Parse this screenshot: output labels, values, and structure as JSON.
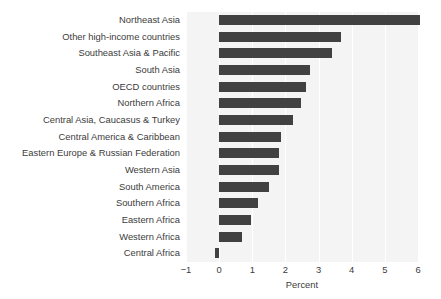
{
  "chart_data": {
    "type": "bar",
    "orientation": "horizontal",
    "title": "",
    "xlabel": "Percent",
    "ylabel": "",
    "xlim": [
      -1,
      6
    ],
    "xticks": [
      -1,
      0,
      1,
      2,
      3,
      4,
      5,
      6
    ],
    "xtick_labels": [
      "−1",
      "0",
      "1",
      "2",
      "3",
      "4",
      "5",
      "6"
    ],
    "grid": true,
    "grid_axis": "x",
    "legend": null,
    "bar_color": "#414141",
    "plot_background": "#f4f4f4",
    "gridline_color": "#ffffff",
    "categories": [
      "Northeast Asia",
      "Other high-income countries",
      "Southeast Asia & Pacific",
      "South Asia",
      "OECD countries",
      "Northern Africa",
      "Central Asia, Caucasus & Turkey",
      "Central America & Caribbean",
      "Eastern Europe & Russian Federation",
      "Western Asia",
      "South America",
      "Southern Africa",
      "Eastern Africa",
      "Western Africa",
      "Central Africa"
    ],
    "values": [
      6.06,
      3.68,
      3.4,
      2.74,
      2.61,
      2.46,
      2.24,
      1.87,
      1.81,
      1.81,
      1.5,
      1.16,
      0.96,
      0.68,
      -0.13
    ]
  },
  "axis": {
    "x_title": "Percent"
  },
  "clipped_header": ""
}
